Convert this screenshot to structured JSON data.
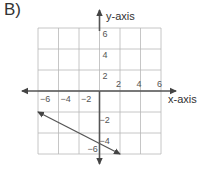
{
  "panel_label": "B)",
  "chart_data": {
    "type": "line",
    "title": "",
    "xlabel": "x-axis",
    "ylabel": "y-axis",
    "xlim": [
      -6,
      6
    ],
    "ylim": [
      -6,
      6
    ],
    "grid": true,
    "grid_step": 2,
    "x_ticks": [
      -6,
      -4,
      -2,
      2,
      4,
      6
    ],
    "y_ticks": [
      6,
      4,
      2,
      -2,
      -4,
      -6
    ],
    "x_tick_labels": [
      "−6",
      "−4",
      "−2",
      "2",
      "4",
      "6"
    ],
    "y_tick_labels": [
      "6",
      "4",
      "2",
      "−2",
      "−4",
      "−6"
    ],
    "axes_arrows": true,
    "series": [
      {
        "name": "line",
        "x": [
          -6,
          2
        ],
        "y": [
          -2,
          -6
        ],
        "arrows_both_ends": true
      }
    ]
  }
}
